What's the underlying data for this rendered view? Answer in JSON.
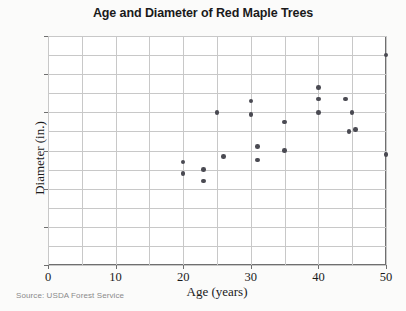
{
  "chart_data": {
    "type": "scatter",
    "title": "Age and Diameter of Red Maple Trees",
    "xlabel": "Age (years)",
    "ylabel": "Diameter (in.)",
    "xlim": [
      0,
      50
    ],
    "ylim": [
      0,
      12
    ],
    "xticks": [
      0,
      10,
      20,
      30,
      40,
      50
    ],
    "yticks": [
      0,
      2,
      4,
      6,
      8,
      10,
      12
    ],
    "x_minor_step": 5,
    "y_minor_step": 1,
    "grid": true,
    "legend": "none",
    "marker_color": "#4a4a52",
    "points": [
      {
        "x": 20,
        "y": 5.4
      },
      {
        "x": 20,
        "y": 4.8
      },
      {
        "x": 23,
        "y": 5.0
      },
      {
        "x": 23,
        "y": 4.4
      },
      {
        "x": 25,
        "y": 8.0
      },
      {
        "x": 26,
        "y": 5.7
      },
      {
        "x": 30,
        "y": 8.6
      },
      {
        "x": 30,
        "y": 7.9
      },
      {
        "x": 31,
        "y": 6.2
      },
      {
        "x": 31,
        "y": 5.5
      },
      {
        "x": 35,
        "y": 7.5
      },
      {
        "x": 35,
        "y": 6.0
      },
      {
        "x": 40,
        "y": 9.3
      },
      {
        "x": 40,
        "y": 8.7
      },
      {
        "x": 40,
        "y": 8.0
      },
      {
        "x": 44,
        "y": 8.7
      },
      {
        "x": 45,
        "y": 8.0
      },
      {
        "x": 44.5,
        "y": 7.0
      },
      {
        "x": 45.5,
        "y": 7.1
      },
      {
        "x": 50,
        "y": 11.0
      },
      {
        "x": 50,
        "y": 5.8
      }
    ]
  },
  "source_note": "Source: USDA Forest Service"
}
